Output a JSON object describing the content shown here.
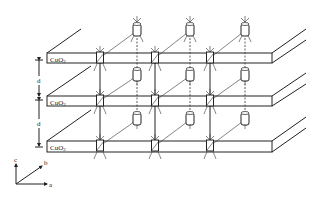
{
  "diagram": {
    "title": "",
    "layers": [
      {
        "label": "CuO",
        "subscript": "2"
      },
      {
        "label": "CuO",
        "subscript": "2"
      },
      {
        "label": "CuO",
        "subscript": "2"
      }
    ],
    "spacing_labels": [
      "d",
      "d"
    ],
    "axes": {
      "c": "c",
      "b": "b",
      "a": "a"
    },
    "colors": {
      "line": "#222222",
      "background": "#ffffff"
    }
  }
}
